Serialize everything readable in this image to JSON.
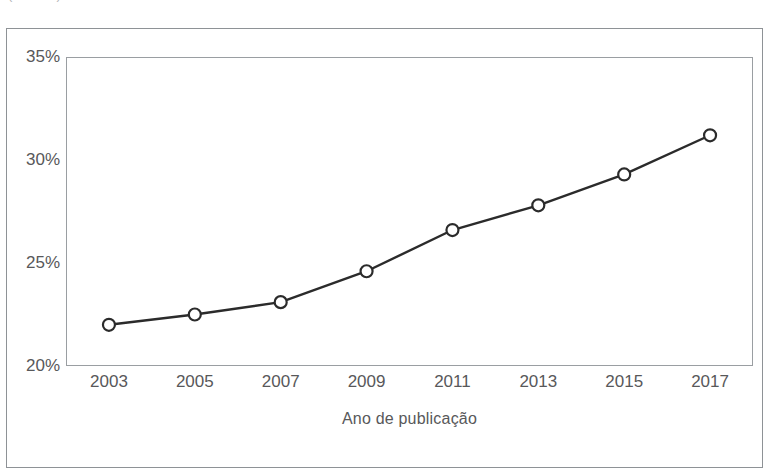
{
  "caption": {
    "text": "(cortado)"
  },
  "figure": {
    "frame_color": "#8e9296",
    "plot_border_color": "#9a9ea2",
    "background": "#ffffff"
  },
  "chart_data": {
    "type": "line",
    "title": "",
    "subtitle": "",
    "xlabel": "Ano de publicação",
    "ylabel": "",
    "categories": [
      2003,
      2005,
      2007,
      2009,
      2011,
      2013,
      2015,
      2017
    ],
    "x": [
      2003,
      2005,
      2007,
      2009,
      2011,
      2013,
      2015,
      2017
    ],
    "values": [
      22.0,
      22.5,
      23.1,
      24.6,
      26.6,
      27.8,
      29.3,
      31.2
    ],
    "series": [
      {
        "name": "",
        "values": [
          22.0,
          22.5,
          23.1,
          24.6,
          26.6,
          27.8,
          29.3,
          31.2
        ]
      }
    ],
    "xtick_labels": [
      "2003",
      "2005",
      "2007",
      "2009",
      "2011",
      "2013",
      "2015",
      "2017"
    ],
    "ytick_values": [
      20,
      25,
      30,
      35
    ],
    "ytick_labels": [
      "20%",
      "25%",
      "30%",
      "35%"
    ],
    "ylim": [
      20,
      35
    ],
    "xlim": [
      2002,
      2018
    ],
    "grid": false,
    "legend": null,
    "legend_position": "none",
    "marker": "circle-open",
    "line_color": "#2b2b2b",
    "marker_fill": "#ffffff",
    "marker_stroke": "#2b2b2b"
  }
}
